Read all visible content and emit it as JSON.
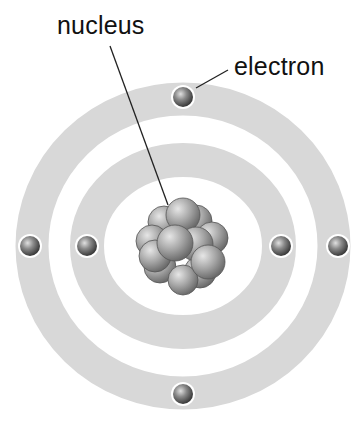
{
  "diagram": {
    "labels": {
      "nucleus": "nucleus",
      "electron": "electron"
    },
    "colors": {
      "ring": "#d6d6d6",
      "electron": "#7a7a7a",
      "nucleon": "#a8a8a8",
      "line": "#222222"
    },
    "shells": [
      {
        "name": "inner-shell",
        "electrons": 2
      },
      {
        "name": "outer-shell",
        "electrons": 4
      }
    ]
  }
}
